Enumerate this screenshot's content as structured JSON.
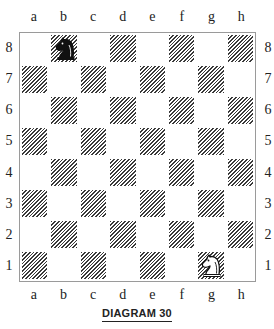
{
  "diagram": {
    "caption": "DIAGRAM 30",
    "files": [
      "a",
      "b",
      "c",
      "d",
      "e",
      "f",
      "g",
      "h"
    ],
    "ranks": [
      "8",
      "7",
      "6",
      "5",
      "4",
      "3",
      "2",
      "1"
    ],
    "square_style": {
      "light": "#ffffff",
      "dark": "diagonal-hatch",
      "hatch_color": "#3a3a3a",
      "border_color": "#9a9a9a"
    },
    "pieces": [
      {
        "square": "b8",
        "type": "knight",
        "color": "black",
        "icon": "black-knight-icon"
      },
      {
        "square": "g1",
        "type": "knight",
        "color": "white",
        "icon": "white-knight-icon"
      }
    ]
  }
}
